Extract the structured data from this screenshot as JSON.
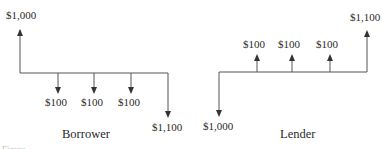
{
  "diagram": {
    "type": "cash-flow-diagram",
    "panels": [
      {
        "title": "Borrower",
        "receipts": [
          {
            "label": "$1,000",
            "period": 0,
            "direction": "up"
          }
        ],
        "payments": [
          {
            "label": "$100",
            "period": 1,
            "direction": "down"
          },
          {
            "label": "$100",
            "period": 2,
            "direction": "down"
          },
          {
            "label": "$100",
            "period": 3,
            "direction": "down"
          },
          {
            "label": "$1,100",
            "period": 4,
            "direction": "down"
          }
        ]
      },
      {
        "title": "Lender",
        "payments": [
          {
            "label": "$1,000",
            "period": 0,
            "direction": "down"
          }
        ],
        "receipts": [
          {
            "label": "$100",
            "period": 1,
            "direction": "up"
          },
          {
            "label": "$100",
            "period": 2,
            "direction": "up"
          },
          {
            "label": "$100",
            "period": 3,
            "direction": "up"
          },
          {
            "label": "$1,100",
            "period": 4,
            "direction": "up"
          }
        ]
      }
    ],
    "caption": "Figure ·  ·  ·  ·"
  },
  "colors": {
    "line": "#555555",
    "text": "#2a2a2a"
  }
}
